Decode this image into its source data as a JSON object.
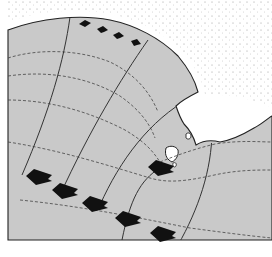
{
  "diagram": {
    "type": "wave-refraction",
    "colors": {
      "sea": "#c9c9c9",
      "land": "#ffffff",
      "coastline": "#222222",
      "orthogonal": "#333333",
      "crest": "#444444",
      "arrow": "#111111",
      "stipple": "#777777"
    },
    "elements": {
      "wave_orthogonals": 5,
      "wave_crests_dashed": 5,
      "incoming_arrows": 6,
      "shore_arrows": 4,
      "islands": 3
    }
  }
}
